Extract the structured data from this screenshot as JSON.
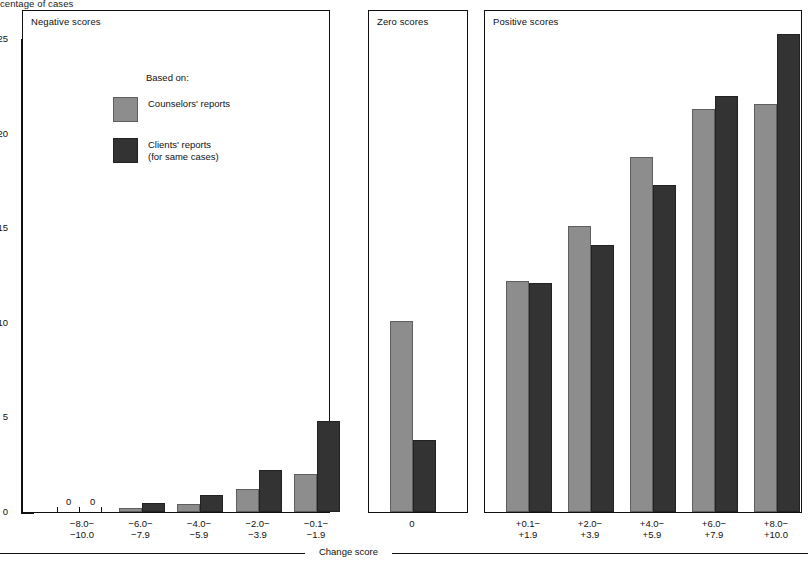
{
  "figure": {
    "y_axis_title": "centage of cases",
    "x_axis_caption": "Change score",
    "y_ticks": [
      0,
      5,
      10,
      15,
      20,
      25
    ],
    "y_max": 26.6,
    "legend_intro": "Based on:",
    "legend": [
      {
        "label": "Counselors' reports",
        "sub": "",
        "color": "#8d8d8d",
        "key": "counselors"
      },
      {
        "label": "Clients' reports",
        "sub": "(for same cases)",
        "color": "#333333",
        "key": "clients"
      }
    ]
  },
  "panels": [
    {
      "id": "negative",
      "title": "Negative scores",
      "categories": [
        "−8.0−|−10.0",
        "−6.0−|−7.9",
        "−4.0−|−5.9",
        "−2.0−|−3.9",
        "−0.1−|−1.9"
      ],
      "category_lines": [
        [
          "−8.0−",
          "−10.0"
        ],
        [
          "−6.0−",
          "−7.9"
        ],
        [
          "−4.0−",
          "−5.9"
        ],
        [
          "−2.0−",
          "−3.9"
        ],
        [
          "−0.1−",
          "−1.9"
        ]
      ],
      "counselors": [
        0,
        0.2,
        0.4,
        1.2,
        2.0
      ],
      "clients": [
        0,
        0.5,
        0.9,
        2.2,
        4.8
      ],
      "zero_markers": [
        "0",
        "0"
      ]
    },
    {
      "id": "zero",
      "title": "Zero scores",
      "categories": [
        "0"
      ],
      "category_lines": [
        [
          "0"
        ]
      ],
      "counselors": [
        10.1
      ],
      "clients": [
        3.8
      ]
    },
    {
      "id": "positive",
      "title": "Positive scores",
      "categories": [
        "+0.1−|+1.9",
        "+2.0−|+3.9",
        "+4.0−|+5.9",
        "+6.0−|+7.9",
        "+8.0−|+10.0"
      ],
      "category_lines": [
        [
          "+0.1−",
          "+1.9"
        ],
        [
          "+2.0−",
          "+3.9"
        ],
        [
          "+4.0−",
          "+5.9"
        ],
        [
          "+6.0−",
          "+7.9"
        ],
        [
          "+8.0−",
          "+10.0"
        ]
      ],
      "counselors": [
        12.2,
        15.1,
        18.8,
        21.3,
        21.6
      ],
      "clients": [
        12.1,
        14.1,
        17.3,
        22.0,
        25.3
      ]
    }
  ],
  "chart_data": {
    "type": "bar",
    "title": "",
    "xlabel": "Change score",
    "ylabel": "Percentage of cases",
    "ylim": [
      0,
      26.6
    ],
    "yticks": [
      0,
      5,
      10,
      15,
      20,
      25
    ],
    "grid": false,
    "legend_position": "inside-upper-left",
    "panels": [
      "Negative scores",
      "Zero scores",
      "Positive scores"
    ],
    "categories": [
      "−8.0 − −10.0",
      "−6.0 − −7.9",
      "−4.0 − −5.9",
      "−2.0 − −3.9",
      "−0.1 − −1.9",
      "0",
      "+0.1 − +1.9",
      "+2.0 − +3.9",
      "+4.0 − +5.9",
      "+6.0 − +7.9",
      "+8.0 − +10.0"
    ],
    "series": [
      {
        "name": "Counselors' reports",
        "color": "#8d8d8d",
        "values": [
          0,
          0.2,
          0.4,
          1.2,
          2.0,
          10.1,
          12.2,
          15.1,
          18.8,
          21.3,
          21.6
        ]
      },
      {
        "name": "Clients' reports (for same cases)",
        "color": "#333333",
        "values": [
          0,
          0.5,
          0.9,
          2.2,
          4.8,
          3.8,
          12.1,
          14.1,
          17.3,
          22.0,
          25.3
        ]
      }
    ],
    "annotations": [
      "0",
      "0"
    ]
  }
}
